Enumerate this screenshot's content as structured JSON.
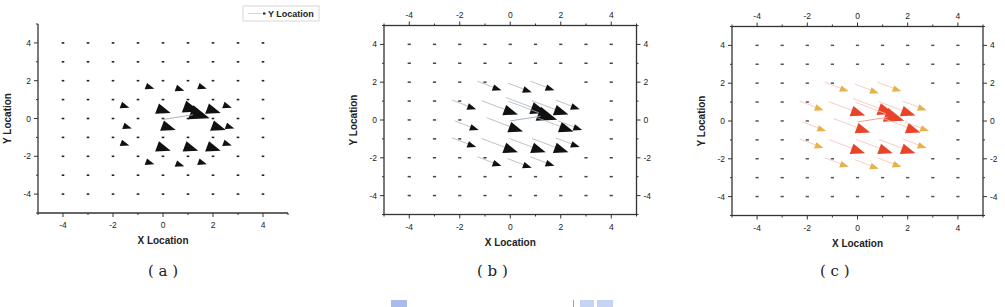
{
  "chart_data": [
    {
      "id": "a",
      "type": "quiver",
      "caption": "( a )",
      "xlabel": "X Location",
      "ylabel": "Y Location",
      "xlim": [
        -5,
        5
      ],
      "ylim": [
        -5,
        5
      ],
      "xticks": [
        "-4",
        "-2",
        "0",
        "2",
        "4"
      ],
      "yticks": [
        "4",
        "2",
        "0",
        "-2",
        "-4"
      ],
      "legend": {
        "label": "Y Location",
        "position": "top-right"
      },
      "grid": false,
      "box": false,
      "arrow_color": "#222222",
      "grid_points": {
        "x": [
          -4,
          -3,
          -2,
          -1,
          0,
          1,
          2,
          3,
          4
        ],
        "y": [
          -4,
          -3,
          -2,
          -1,
          0,
          1,
          2,
          3,
          4
        ]
      },
      "description": "Uniform 9x9 grid of tiny arrows of nearly equal small magnitude"
    },
    {
      "id": "b",
      "type": "quiver",
      "caption": "( b )",
      "xlabel": "X Location",
      "ylabel": "Y Location",
      "xlim": [
        -5,
        5
      ],
      "ylim": [
        -5,
        5
      ],
      "xticks": [
        "-4",
        "-2",
        "0",
        "2",
        "4"
      ],
      "yticks": [
        "4",
        "2",
        "0",
        "-2",
        "-4"
      ],
      "top_xticks": [
        "-4",
        "-2",
        "0",
        "2",
        "4"
      ],
      "right_yticks": [
        "4",
        "2",
        "0",
        "-2",
        "-4"
      ],
      "grid": false,
      "box": true,
      "arrow_color": "#111111",
      "tail_color": "#a9b4c2",
      "description": "Arrows pointing down-right; large magnitude near centre (~1,0), small at edges",
      "large_arrows": [
        {
          "x": -0.6,
          "y": 1.7,
          "s": 1
        },
        {
          "x": 0.6,
          "y": 1.6,
          "s": 1
        },
        {
          "x": 1.5,
          "y": 1.7,
          "s": 1
        },
        {
          "x": -1.6,
          "y": 0.7,
          "s": 1
        },
        {
          "x": -0.1,
          "y": 0.5,
          "s": 2
        },
        {
          "x": 1.0,
          "y": 0.6,
          "s": 2.4
        },
        {
          "x": 1.3,
          "y": 0.3,
          "s": 3
        },
        {
          "x": 1.9,
          "y": 0.5,
          "s": 2
        },
        {
          "x": 2.5,
          "y": 0.7,
          "s": 1
        },
        {
          "x": -1.5,
          "y": -0.4,
          "s": 1
        },
        {
          "x": 0.1,
          "y": -0.4,
          "s": 2
        },
        {
          "x": 2.1,
          "y": -0.4,
          "s": 2
        },
        {
          "x": 2.6,
          "y": -0.4,
          "s": 1
        },
        {
          "x": -1.6,
          "y": -1.3,
          "s": 1
        },
        {
          "x": -0.1,
          "y": -1.5,
          "s": 2
        },
        {
          "x": 1.0,
          "y": -1.5,
          "s": 2
        },
        {
          "x": 1.9,
          "y": -1.5,
          "s": 2
        },
        {
          "x": 2.5,
          "y": -1.3,
          "s": 1
        },
        {
          "x": -0.6,
          "y": -2.3,
          "s": 1
        },
        {
          "x": 0.6,
          "y": -2.4,
          "s": 1
        },
        {
          "x": 1.5,
          "y": -2.3,
          "s": 1
        }
      ]
    },
    {
      "id": "c",
      "type": "quiver",
      "caption": "( c )",
      "xlabel": "X Location",
      "ylabel": "Y Location",
      "xlim": [
        -5,
        5
      ],
      "ylim": [
        -5,
        5
      ],
      "xticks": [
        "-4",
        "-2",
        "0",
        "2",
        "4"
      ],
      "yticks": [
        "4",
        "2",
        "0",
        "-2",
        "-4"
      ],
      "top_xticks": [
        "-4",
        "-2",
        "0",
        "2",
        "4"
      ],
      "right_yticks": [
        "4",
        "2",
        "0",
        "-2",
        "-4"
      ],
      "grid": false,
      "box": true,
      "colors": {
        "high": "#e8442a",
        "mid": "#e8b24a",
        "low": "#444444"
      },
      "description": "Same vector field as (b), coloured by magnitude: red high, yellow medium, dark small"
    }
  ],
  "captions": {
    "a": "( a )",
    "b": "( b )",
    "c": "( c )"
  },
  "axes": {
    "x_label": "X Location",
    "y_label": "Y Location",
    "legend_label": "Y Location",
    "ticks": [
      "-4",
      "-2",
      "0",
      "2",
      "4"
    ],
    "yticks": [
      "4",
      "2",
      "0",
      "-2",
      "-4"
    ]
  },
  "footer_artifact_colors": [
    "#9fb3e6",
    "#c9d6f5",
    "#c9d6f5"
  ]
}
